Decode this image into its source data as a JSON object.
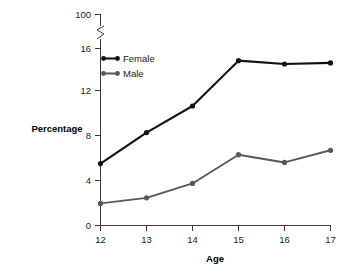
{
  "chart_data": {
    "type": "line",
    "title": "",
    "xlabel": "Age",
    "ylabel": "Percentage",
    "x": [
      12,
      13,
      14,
      15,
      16,
      17
    ],
    "xticklabels": [
      "12",
      "13",
      "14",
      "15",
      "16",
      "17"
    ],
    "yticks": [
      0,
      4,
      8,
      12,
      16,
      100
    ],
    "yticklabels": [
      "0",
      "4",
      "8",
      "12",
      "16",
      "100"
    ],
    "ylim": [
      0,
      16
    ],
    "axis_break": true,
    "axis_break_note": "y-axis broken between 16 and 100",
    "grid": false,
    "legend_position": "upper-left-inside",
    "series": [
      {
        "name": "Female",
        "color": "#111111",
        "values": [
          5.6,
          8.4,
          10.8,
          14.9,
          14.6,
          14.7
        ]
      },
      {
        "name": "Male",
        "color": "#595959",
        "values": [
          2.0,
          2.5,
          3.8,
          6.4,
          5.7,
          6.8
        ]
      }
    ]
  },
  "axes": {
    "y_axis_title": "Percentage",
    "x_axis_title": "Age"
  },
  "legend": {
    "items": [
      {
        "label": "Female",
        "color": "#111111"
      },
      {
        "label": "Male",
        "color": "#595959"
      }
    ]
  },
  "colors": {
    "female": "#111111",
    "male": "#595959",
    "axis": "#3a3a3a",
    "text": "#1a1a1a",
    "background": "#ffffff"
  }
}
